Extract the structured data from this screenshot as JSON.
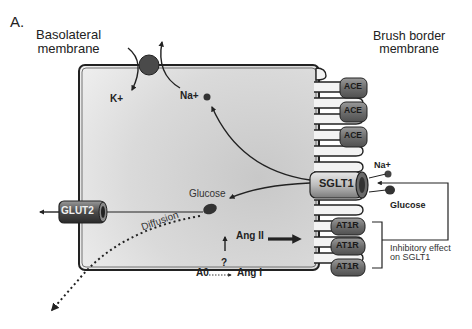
{
  "panel_label": "A.",
  "labels": {
    "basolateral": "Basolateral\nmembrane",
    "brush_border": "Brush border\nmembrane",
    "k_ion": "K+",
    "na_ion_inside": "Na+",
    "na_ion_outside": "Na+",
    "glucose_inside": "Glucose",
    "glucose_outside": "Glucose",
    "diffusion": "Diffusion",
    "ang_ii": "Ang II",
    "ang_i": "Ang I",
    "a0": "A0",
    "question": "?",
    "inhibitory": "Inhibitory effect\non SGLT1"
  },
  "transporters": {
    "sglt1": "SGLT1",
    "glut2": "GLUT2"
  },
  "enzymes": [
    "ACE",
    "ACE",
    "ACE"
  ],
  "receptors": [
    "AT1R",
    "AT1R",
    "AT1R"
  ],
  "colors": {
    "cell_fill": "#d4d4d4",
    "outline": "#222222",
    "protein": "#7a7a7a",
    "pump": "#444444"
  }
}
